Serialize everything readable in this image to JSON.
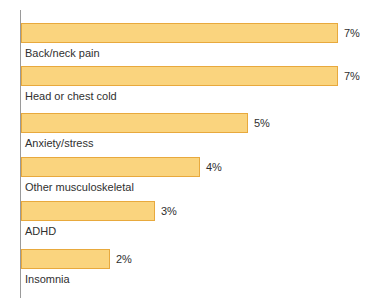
{
  "chart_data": {
    "type": "bar",
    "orientation": "horizontal",
    "title": "",
    "subtitle": "",
    "xlabel": "",
    "ylabel": "",
    "grid": false,
    "legend": false,
    "axis_line": "vertical-category-axis",
    "xlim": [
      0,
      8
    ],
    "categories": [
      "Back/neck pain",
      "Head or chest cold",
      "Anxiety/stress",
      "Other musculoskeletal",
      "ADHD",
      "Insomnia"
    ],
    "values": [
      7,
      7,
      5,
      4,
      3,
      2
    ],
    "value_labels": [
      "7%",
      "7%",
      "5%",
      "4%",
      "3%",
      "2%"
    ],
    "colors": {
      "bar_fill": "#fad47e",
      "bar_border": "#e8a93d",
      "axis": "#9a9a9a",
      "text": "#2f2f2f",
      "background": "#ffffff"
    }
  },
  "bars": [
    {
      "label": "Back/neck pain",
      "value_label": "7%",
      "width_px": 317,
      "top_px": 23
    },
    {
      "label": "Head or chest cold",
      "value_label": "7%",
      "width_px": 317,
      "top_px": 66
    },
    {
      "label": "Anxiety/stress",
      "value_label": "5%",
      "width_px": 227,
      "top_px": 113
    },
    {
      "label": "Other musculoskeletal",
      "value_label": "4%",
      "width_px": 179,
      "top_px": 157
    },
    {
      "label": "ADHD",
      "value_label": "3%",
      "width_px": 134,
      "top_px": 201
    },
    {
      "label": "Insomnia",
      "value_label": "2%",
      "width_px": 89,
      "top_px": 249
    }
  ]
}
